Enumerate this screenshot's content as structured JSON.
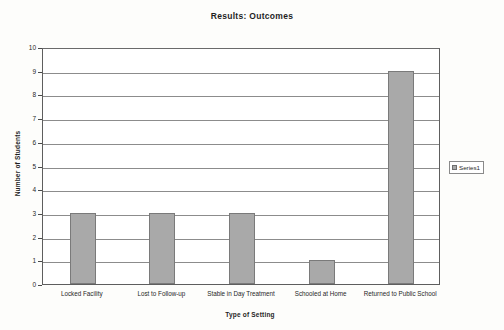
{
  "chart_data": {
    "type": "bar",
    "title": "Results:  Outcomes",
    "xlabel": "Type of Setting",
    "ylabel": "Number of Students",
    "categories": [
      "Locked Facility",
      "Lost to Follow-up",
      "Stable in Day Treatment",
      "Schooled at Home",
      "Returned to Public School"
    ],
    "values": [
      3,
      3,
      3,
      1,
      9
    ],
    "series": [
      {
        "name": "Series1",
        "values": [
          3,
          3,
          3,
          1,
          9
        ]
      }
    ],
    "ylim": [
      0,
      10
    ],
    "ytick_labels": [
      "0",
      "1",
      "2",
      "3",
      "4",
      "5",
      "6",
      "7",
      "8",
      "9",
      "10"
    ],
    "grid": "horizontal",
    "legend_position": "right",
    "legend_entries": [
      "Series1"
    ],
    "bar_color": "#a9a9a9",
    "bar_border_color": "#7a7a7a",
    "gridline_color": "#8c8c8c",
    "background_color": "#fdfdfb"
  }
}
